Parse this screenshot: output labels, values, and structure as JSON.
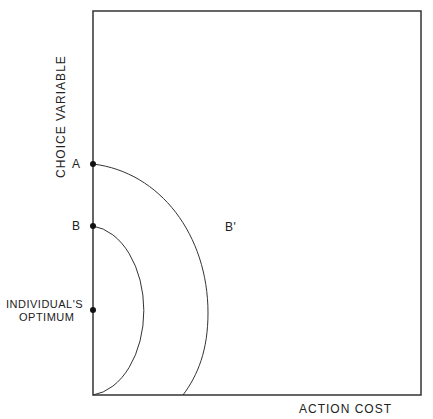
{
  "diagram": {
    "y_axis_label": "CHOICE  VARIABLE",
    "x_axis_label": "ACTION  COST",
    "points": [
      {
        "id": "A",
        "label": "A"
      },
      {
        "id": "B",
        "label": "B"
      },
      {
        "id": "optimum",
        "label_line1": "INDIVIDUAL'S",
        "label_line2": "OPTIMUM"
      }
    ],
    "curve_label": "B'",
    "colors": {
      "line": "#333333",
      "dot": "#111111"
    }
  }
}
